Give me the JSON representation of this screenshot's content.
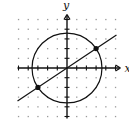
{
  "diagram": {
    "type": "coordinate-graph",
    "axis_labels": {
      "x": "x",
      "y": "y"
    },
    "grid": {
      "min": -5,
      "max": 5,
      "step": 1,
      "style": "dotted"
    },
    "circle": {
      "center": [
        0,
        0
      ],
      "radius_squared": 13
    },
    "line": {
      "slope_num": 2,
      "slope_den": 3,
      "intercept": 0
    },
    "intersection_points": [
      [
        3,
        2
      ],
      [
        -3,
        -2
      ]
    ]
  },
  "colors": {
    "ink": "#111111",
    "grid_dot": "#9a9a9a",
    "background": "#ffffff"
  }
}
